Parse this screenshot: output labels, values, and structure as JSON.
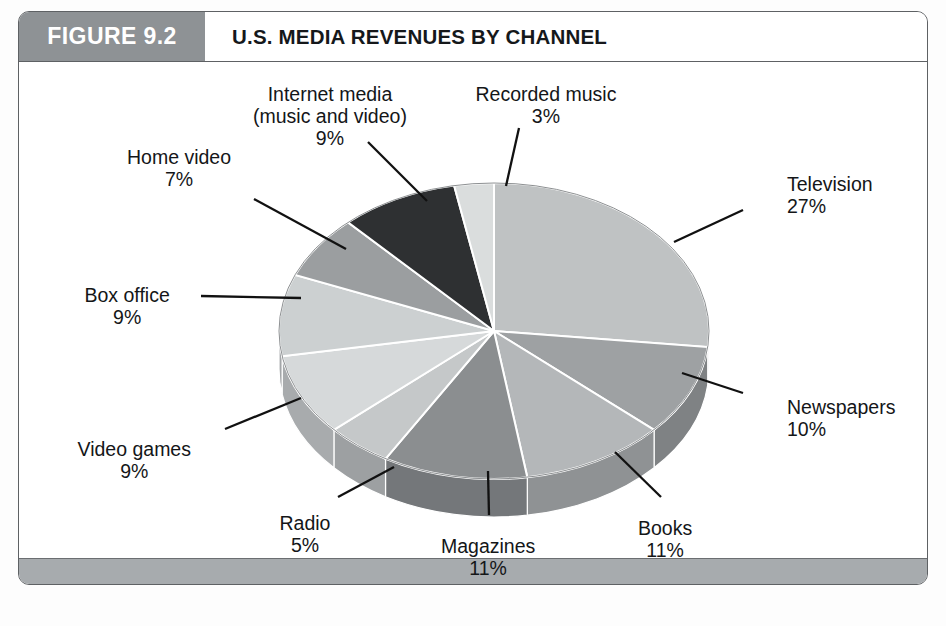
{
  "figure": {
    "number_label": "FIGURE 9.2",
    "title": "U.S. MEDIA REVENUES BY CHANNEL",
    "source_note": ""
  },
  "colors": {
    "header_block": "#8e9295",
    "header_text": "#ffffff",
    "title_text": "#15181b",
    "frame": "#5e6164",
    "footer_bar": "#a7abae",
    "label_text": "#141618",
    "leader_line": "#111111"
  },
  "chart_data": {
    "type": "pie",
    "title": "U.S. MEDIA REVENUES BY CHANNEL",
    "subtitle": "",
    "xlabel": "",
    "ylabel": "",
    "grid": false,
    "legend_position": "none",
    "value_unit": "percent",
    "labels_show_percent": true,
    "categories": [
      "Television",
      "Newspapers",
      "Books",
      "Magazines",
      "Radio",
      "Video games",
      "Box office",
      "Home video",
      "Internet media (music and video)",
      "Recorded music"
    ],
    "values": [
      27,
      10,
      11,
      11,
      5,
      9,
      9,
      7,
      9,
      3
    ],
    "slices": [
      {
        "name": "Television",
        "label_line1": "Television",
        "label_line2": "27%",
        "value": 27,
        "color": "#bfc2c3",
        "side_color": "#9a9d9f",
        "label_x": 786,
        "label_y": 172,
        "label_align": "left",
        "leader": {
          "x1": 742,
          "y1": 209,
          "x2": 673,
          "y2": 241
        }
      },
      {
        "name": "Newspapers",
        "label_line1": "Newspapers",
        "label_line2": "10%",
        "value": 10,
        "color": "#9ea1a3",
        "side_color": "#7f8284",
        "label_x": 786,
        "label_y": 395,
        "label_align": "left",
        "leader": {
          "x1": 742,
          "y1": 392,
          "x2": 681,
          "y2": 372
        }
      },
      {
        "name": "Books",
        "label_line1": "Books",
        "label_line2": "11%",
        "value": 11,
        "color": "#b4b7b9",
        "side_color": "#8f9294",
        "label_x": 664,
        "label_y": 516,
        "label_align": "center",
        "leader": {
          "x1": 660,
          "y1": 496,
          "x2": 614,
          "y2": 451
        }
      },
      {
        "name": "Magazines",
        "label_line1": "Magazines",
        "label_line2": "11%",
        "value": 11,
        "color": "#8b8e90",
        "side_color": "#74777a",
        "label_x": 487,
        "label_y": 534,
        "label_align": "center",
        "leader": {
          "x1": 488,
          "y1": 514,
          "x2": 487,
          "y2": 470
        }
      },
      {
        "name": "Radio",
        "label_line1": "Radio",
        "label_line2": "5%",
        "value": 5,
        "color": "#c5c8c9",
        "side_color": "#9da0a2",
        "label_x": 304,
        "label_y": 511,
        "label_align": "center",
        "leader": {
          "x1": 337,
          "y1": 496,
          "x2": 393,
          "y2": 466
        }
      },
      {
        "name": "Video games",
        "label_line1": "Video games",
        "label_line2": "9%",
        "value": 9,
        "color": "#d6d9da",
        "side_color": "#a8abad",
        "label_x": 133,
        "label_y": 437,
        "label_align": "center",
        "leader": {
          "x1": 224,
          "y1": 428,
          "x2": 300,
          "y2": 397
        }
      },
      {
        "name": "Box office",
        "label_line1": "Box office",
        "label_line2": "9%",
        "value": 9,
        "color": "#ccd0d1",
        "side_color": "#a3a6a8",
        "label_x": 126,
        "label_y": 283,
        "label_align": "center",
        "leader": {
          "x1": 200,
          "y1": 295,
          "x2": 300,
          "y2": 297
        }
      },
      {
        "name": "Home video",
        "label_line1": "Home video",
        "label_line2": "7%",
        "value": 7,
        "color": "#9b9ea0",
        "side_color": "#7d8082",
        "label_x": 178,
        "label_y": 145,
        "label_align": "center",
        "leader": {
          "x1": 253,
          "y1": 198,
          "x2": 345,
          "y2": 248
        }
      },
      {
        "name": "Internet media (music and video)",
        "label_line1": "Internet media",
        "label_line1b": "(music and video)",
        "label_line2": "9%",
        "value": 9,
        "color": "#2e3032",
        "side_color": "#2e3032",
        "label_x": 329,
        "label_y": 82,
        "label_align": "center",
        "leader": {
          "x1": 367,
          "y1": 141,
          "x2": 426,
          "y2": 200
        }
      },
      {
        "name": "Recorded music",
        "label_line1": "Recorded music",
        "label_line2": "3%",
        "value": 3,
        "color": "#dadddd",
        "side_color": "#abaeb0",
        "label_x": 545,
        "label_y": 82,
        "label_align": "center",
        "leader": {
          "x1": 518,
          "y1": 127,
          "x2": 505,
          "y2": 185
        }
      }
    ],
    "total": 101,
    "geometry": {
      "center_x": 493,
      "center_y": 330,
      "radius_x": 215,
      "radius_y": 148,
      "depth": 38,
      "start_angle_deg": -90
    }
  }
}
